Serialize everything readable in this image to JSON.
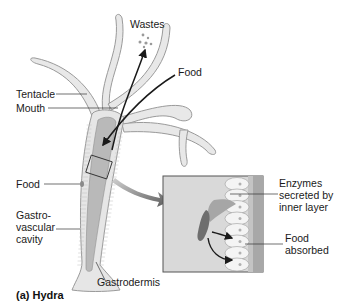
{
  "figure": {
    "caption": "(a) Hydra",
    "labels": {
      "wastes": "Wastes",
      "food_in": "Food",
      "tentacle": "Tentacle",
      "mouth": "Mouth",
      "food_body": "Food",
      "gvc_line1": "Gastro-",
      "gvc_line2": "vascular",
      "gvc_line3": "cavity",
      "gastrodermis": "Gastrodermis"
    },
    "inset": {
      "enzymes_line1": "Enzymes",
      "enzymes_line2": "secreted by",
      "enzymes_line3": "inner layer",
      "absorbed_line1": "Food",
      "absorbed_line2": "absorbed"
    },
    "colors": {
      "body_fill": "#e4e4e4",
      "body_outline": "#9a9a9a",
      "cavity": "#b9b9b9",
      "inset_bg": "#d9d9d9",
      "arrow": "#1a1a1a",
      "pointer_arrow": "#6e6e6e"
    }
  }
}
